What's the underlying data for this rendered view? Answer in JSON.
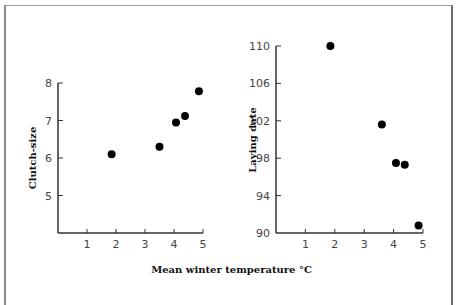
{
  "chart_data": [
    {
      "type": "scatter",
      "title": "",
      "xlabel": "Mean winter temperature °C",
      "ylabel": "Clutch-size",
      "xlim": [
        0,
        5
      ],
      "ylim": [
        4,
        8
      ],
      "xticks": [
        1,
        2,
        3,
        4,
        5
      ],
      "yticks": [
        5,
        6,
        7,
        8
      ],
      "grid": false,
      "x": [
        1.85,
        3.5,
        4.07,
        4.38,
        4.86
      ],
      "y": [
        6.1,
        6.3,
        6.95,
        7.12,
        7.78
      ]
    },
    {
      "type": "scatter",
      "title": "",
      "xlabel": "Mean winter temperature °C",
      "ylabel": "Laying date",
      "xlim": [
        0,
        5
      ],
      "ylim": [
        90,
        110
      ],
      "xticks": [
        1,
        2,
        3,
        4,
        5
      ],
      "yticks": [
        90,
        94,
        98,
        102,
        106,
        110
      ],
      "grid": false,
      "x": [
        1.85,
        3.6,
        4.08,
        4.38,
        4.85
      ],
      "y": [
        110,
        101.6,
        97.5,
        97.3,
        90.8
      ]
    }
  ],
  "labels": {
    "shared_xlabel": "Mean winter temperature °C",
    "left_ylabel": "Clutch-size",
    "right_ylabel": "Laying date"
  }
}
